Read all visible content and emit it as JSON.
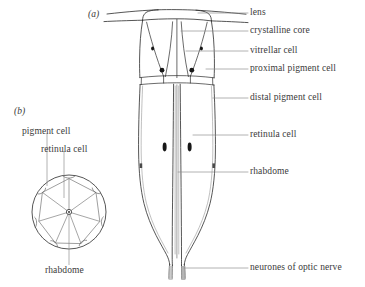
{
  "figure": {
    "panels": [
      {
        "tag": "(a)",
        "name": "longitudinal-section"
      },
      {
        "tag": "(b)",
        "name": "transverse-section"
      }
    ]
  },
  "panel_a": {
    "tag": "(a)",
    "labels": [
      {
        "key": "lens",
        "text": "lens"
      },
      {
        "key": "crystalline_core",
        "text": "crystalline core"
      },
      {
        "key": "vitrellar_cell",
        "text": "vitrellar cell"
      },
      {
        "key": "proximal_pigment_cell",
        "text": "proximal pigment cell"
      },
      {
        "key": "distal_pigment_cell",
        "text": "distal pigment cell"
      },
      {
        "key": "retinula_cell",
        "text": "retinula cell"
      },
      {
        "key": "rhabdome",
        "text": "rhabdome"
      },
      {
        "key": "optic_nerve",
        "text": "neurones of optic nerve"
      }
    ]
  },
  "panel_b": {
    "tag": "(b)",
    "labels": [
      {
        "key": "pigment_cell",
        "text": "pigment cell"
      },
      {
        "key": "retinula_cell",
        "text": "retinula cell"
      },
      {
        "key": "rhabdome",
        "text": "rhabdome"
      }
    ]
  },
  "colors": {
    "ink": "#2b2b2b",
    "ink_light": "#6a6a6a",
    "leader": "#8a8a8a",
    "nucleus": "#171717",
    "background": "#ffffff"
  }
}
